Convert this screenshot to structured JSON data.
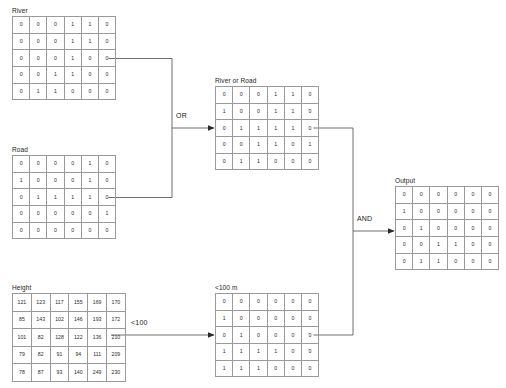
{
  "diagram": {
    "title_alt": "Map algebra raster overlay flow",
    "operators": [
      {
        "name": "or-operator",
        "label": "OR"
      },
      {
        "name": "and-operator",
        "label": "AND"
      },
      {
        "name": "threshold-operator",
        "label": "<100"
      }
    ],
    "grids": [
      {
        "id": "river",
        "label": "River",
        "kind": "binary",
        "rows": [
          [
            "0",
            "0",
            "0",
            "1",
            "1",
            "0"
          ],
          [
            "0",
            "0",
            "0",
            "1",
            "1",
            "0"
          ],
          [
            "0",
            "0",
            "0",
            "1",
            "0",
            "0"
          ],
          [
            "0",
            "0",
            "1",
            "1",
            "0",
            "0"
          ],
          [
            "0",
            "1",
            "1",
            "0",
            "0",
            "0"
          ]
        ]
      },
      {
        "id": "road",
        "label": "Road",
        "kind": "binary",
        "rows": [
          [
            "0",
            "0",
            "0",
            "0",
            "1",
            "0"
          ],
          [
            "1",
            "0",
            "0",
            "0",
            "1",
            "0"
          ],
          [
            "0",
            "1",
            "1",
            "1",
            "1",
            "0"
          ],
          [
            "0",
            "0",
            "0",
            "0",
            "0",
            "1"
          ],
          [
            "0",
            "0",
            "0",
            "0",
            "0",
            "0"
          ]
        ]
      },
      {
        "id": "river-or-road",
        "label": "River or Road",
        "kind": "binary",
        "rows": [
          [
            "0",
            "0",
            "0",
            "1",
            "1",
            "0"
          ],
          [
            "1",
            "0",
            "0",
            "1",
            "1",
            "0"
          ],
          [
            "0",
            "1",
            "1",
            "1",
            "1",
            "0"
          ],
          [
            "0",
            "0",
            "1",
            "1",
            "0",
            "1"
          ],
          [
            "0",
            "1",
            "1",
            "0",
            "0",
            "0"
          ]
        ]
      },
      {
        "id": "height",
        "label": "Height",
        "kind": "height",
        "rows": [
          [
            "121",
            "123",
            "117",
            "155",
            "169",
            "170"
          ],
          [
            "85",
            "143",
            "102",
            "146",
            "193",
            "172"
          ],
          [
            "101",
            "82",
            "128",
            "122",
            "136",
            "210"
          ],
          [
            "79",
            "82",
            "91",
            "94",
            "111",
            "209"
          ],
          [
            "78",
            "87",
            "93",
            "140",
            "249",
            "230"
          ]
        ]
      },
      {
        "id": "below-100m",
        "label": "<100 m",
        "kind": "binary",
        "rows": [
          [
            "0",
            "0",
            "0",
            "0",
            "0",
            "0"
          ],
          [
            "1",
            "0",
            "0",
            "0",
            "0",
            "0"
          ],
          [
            "0",
            "1",
            "0",
            "0",
            "0",
            "0"
          ],
          [
            "1",
            "1",
            "1",
            "1",
            "0",
            "0"
          ],
          [
            "1",
            "1",
            "1",
            "0",
            "0",
            "0"
          ]
        ]
      },
      {
        "id": "output",
        "label": "Output",
        "kind": "binary",
        "rows": [
          [
            "0",
            "0",
            "0",
            "0",
            "0",
            "0"
          ],
          [
            "1",
            "0",
            "0",
            "0",
            "0",
            "0"
          ],
          [
            "0",
            "1",
            "0",
            "0",
            "0",
            "0"
          ],
          [
            "0",
            "0",
            "1",
            "1",
            "0",
            "0"
          ],
          [
            "0",
            "1",
            "1",
            "0",
            "0",
            "0"
          ]
        ]
      }
    ],
    "colors": {
      "grid_line": "#9a9a9a",
      "connector": "#4a4a4a",
      "text": "#1a1a1a",
      "background": "#ffffff"
    }
  }
}
